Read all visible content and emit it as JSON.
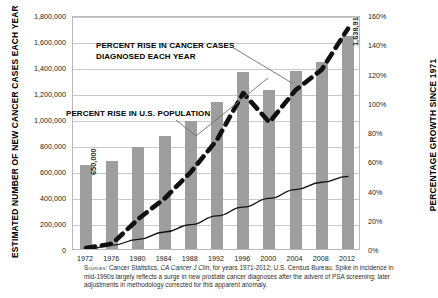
{
  "axes": {
    "left_title": "ESTIMATED NUMBER OF NEW CANCER CASES EACH YEAR",
    "right_title": "PERCENTAGE GROWTH SINCE 1971"
  },
  "annotations": {
    "cancer_line1": "PERCENT RISE IN CANCER CASES",
    "cancer_line2": "DIAGNOSED EACH YEAR",
    "population": "PERCENT RISE IN U.S. POPULATION"
  },
  "bar_labels": {
    "first": "650,000",
    "last": "1,638,910"
  },
  "source": {
    "prefix": "Sources:",
    "text_a": " Cancer Statistics, ",
    "italic_a": "CA Cancer J Clin",
    "text_b": ", for years 1971-2012; U.S. Census Bureau. Spike in incidence in mid-1990s largely reflects a surge in new prostate cancer diagnoses after the advent of PSA screening; later adjustments in methodology corrected for this apparent anomaly."
  },
  "colors": {
    "bar": "#9e9e9e",
    "grid": "#c9c9c9",
    "dashed_series": "#111111",
    "thin_series": "#111111",
    "leader": "#6f6f6f"
  },
  "chart_data": {
    "type": "bar",
    "title": "",
    "xlabel": "",
    "ylabel": "ESTIMATED NUMBER OF NEW CANCER CASES EACH YEAR",
    "y2label": "PERCENTAGE GROWTH SINCE 1971",
    "categories": [
      "1972",
      "1976",
      "1980",
      "1984",
      "1988",
      "1992",
      "1996",
      "2000",
      "2004",
      "2008",
      "2012"
    ],
    "ylim": [
      0,
      1800000
    ],
    "yticks": [
      "0",
      "200,000",
      "400,000",
      "600,000",
      "800,000",
      "1,000,000",
      "1,200,000",
      "1,400,000",
      "1,600,000",
      "1,800,000"
    ],
    "ytick_values": [
      0,
      200000,
      400000,
      600000,
      800000,
      1000000,
      1200000,
      1400000,
      1600000,
      1800000
    ],
    "y2lim": [
      0,
      160
    ],
    "y2ticks": [
      "0%",
      "20%",
      "40%",
      "60%",
      "80%",
      "100%",
      "120%",
      "140%",
      "160%"
    ],
    "y2tick_values": [
      0,
      20,
      40,
      60,
      80,
      100,
      120,
      140,
      160
    ],
    "grid": true,
    "legend": "none",
    "series": [
      {
        "name": "Estimated new cancer cases each year",
        "type": "bar",
        "axis": "left",
        "values": [
          650000,
          675000,
          785000,
          870000,
          985000,
          1130000,
          1360000,
          1220000,
          1370000,
          1440000,
          1638910
        ]
      },
      {
        "name": "PERCENT RISE IN CANCER CASES DIAGNOSED EACH YEAR",
        "type": "line",
        "style": "dashed",
        "axis": "right",
        "values": [
          2,
          5,
          22,
          36,
          54,
          76,
          108,
          88,
          110,
          124,
          152
        ]
      },
      {
        "name": "PERCENT RISE IN U.S. POPULATION",
        "type": "line",
        "style": "solid",
        "axis": "right",
        "values": [
          1,
          4,
          8,
          13,
          18,
          24,
          30,
          36,
          42,
          47,
          51
        ]
      }
    ]
  }
}
